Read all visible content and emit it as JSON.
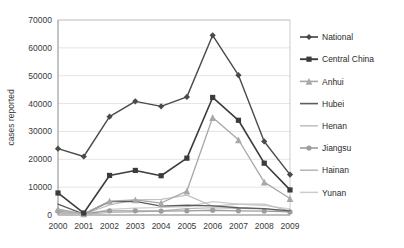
{
  "chart_data": {
    "type": "line",
    "title": "",
    "xlabel": "",
    "ylabel": "cases reported",
    "categories": [
      "2000",
      "2001",
      "2002",
      "2003",
      "2004",
      "2005",
      "2006",
      "2007",
      "2008",
      "2009"
    ],
    "x": [
      2000,
      2001,
      2002,
      2003,
      2004,
      2005,
      2006,
      2007,
      2008,
      2009
    ],
    "ylim": [
      0,
      70000
    ],
    "ytick_labels": [
      "0",
      "10000",
      "20000",
      "30000",
      "40000",
      "50000",
      "60000",
      "70000"
    ],
    "yticks": [
      0,
      10000,
      20000,
      30000,
      40000,
      50000,
      60000,
      70000
    ],
    "grid": true,
    "legend_position": "right",
    "series": [
      {
        "name": "National",
        "color": "#4a4a4a",
        "marker": "diamond",
        "width": 1.4,
        "values": [
          23800,
          21000,
          35300,
          40800,
          39000,
          42400,
          64500,
          50200,
          26400,
          14500
        ]
      },
      {
        "name": "Central China",
        "color": "#3c3c3c",
        "marker": "square",
        "width": 1.6,
        "values": [
          7900,
          700,
          14200,
          16000,
          14100,
          20400,
          42200,
          34000,
          18600,
          9000
        ]
      },
      {
        "name": "Anhui",
        "color": "#a8a8a8",
        "marker": "triangle",
        "width": 1.3,
        "values": [
          2100,
          400,
          5000,
          5400,
          4300,
          8600,
          35000,
          27000,
          11800,
          5900
        ]
      },
      {
        "name": "Hubei",
        "color": "#5c5c5c",
        "marker": "none",
        "width": 1.3,
        "values": [
          3900,
          300,
          4800,
          4900,
          3200,
          3500,
          3300,
          2600,
          2300,
          1500
        ]
      },
      {
        "name": "Henan",
        "color": "#c2c2c2",
        "marker": "none",
        "width": 1.3,
        "values": [
          1900,
          200,
          3600,
          5400,
          5600,
          7100,
          3200,
          3900,
          3900,
          1400
        ]
      },
      {
        "name": "Jiangsu",
        "color": "#9d9d9d",
        "marker": "circle",
        "width": 1.3,
        "values": [
          1400,
          500,
          1500,
          1500,
          1400,
          1500,
          1700,
          1500,
          1400,
          1100
        ]
      },
      {
        "name": "Hainan",
        "color": "#b5b5b5",
        "marker": "none",
        "width": 1.2,
        "values": [
          700,
          200,
          900,
          1100,
          1500,
          2300,
          2600,
          2400,
          2200,
          1100
        ]
      },
      {
        "name": "Yunan",
        "color": "#cccccc",
        "marker": "none",
        "width": 1.2,
        "values": [
          1000,
          150,
          2000,
          2500,
          2700,
          3000,
          4800,
          3900,
          3400,
          2200
        ]
      }
    ]
  }
}
